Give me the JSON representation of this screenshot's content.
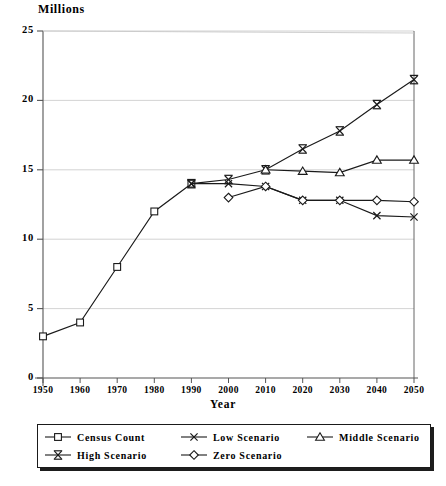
{
  "chart_data": {
    "type": "line",
    "title": "",
    "unit_label": "Millions",
    "xlabel": "Year",
    "ylabel": "",
    "x": [
      1950,
      1960,
      1970,
      1980,
      1990,
      2000,
      2010,
      2020,
      2030,
      2040,
      2050
    ],
    "xtick_labels": [
      "1950",
      "1960",
      "1970",
      "1980",
      "1990",
      "2000",
      "2010",
      "2020",
      "2030",
      "2040",
      "2050"
    ],
    "ytick_labels": [
      "0",
      "5",
      "10",
      "15",
      "20",
      "25"
    ],
    "ytick_values": [
      0,
      5,
      10,
      15,
      20,
      25
    ],
    "ylim": [
      0,
      25
    ],
    "xlim": [
      1950,
      2050
    ],
    "grid": "horizontal",
    "legend_position": "bottom",
    "series": [
      {
        "name": "Census Count",
        "marker": "square",
        "x": [
          1950,
          1960,
          1970,
          1980,
          1990
        ],
        "values": [
          3.0,
          4.0,
          8.0,
          12.0,
          14.0
        ]
      },
      {
        "name": "High Scenario",
        "marker": "i-bar",
        "x": [
          1990,
          2000,
          2010,
          2020,
          2030,
          2040,
          2050
        ],
        "values": [
          14.0,
          14.3,
          15.0,
          16.5,
          17.8,
          19.7,
          21.5
        ]
      },
      {
        "name": "Middle Scenario",
        "marker": "triangle",
        "x": [
          2010,
          2020,
          2030,
          2040,
          2050
        ],
        "values": [
          15.0,
          14.9,
          14.8,
          15.7,
          15.7
        ]
      },
      {
        "name": "Low Scenario",
        "marker": "x",
        "x": [
          1990,
          2000,
          2010,
          2020,
          2030,
          2040,
          2050
        ],
        "values": [
          14.0,
          14.0,
          13.8,
          12.8,
          12.8,
          11.7,
          11.6
        ]
      },
      {
        "name": "Zero Scenario",
        "marker": "diamond",
        "x": [
          2000,
          2010,
          2020,
          2030,
          2040,
          2050
        ],
        "values": [
          13.0,
          13.8,
          12.8,
          12.8,
          12.8,
          12.7
        ]
      }
    ],
    "colors": {
      "line": "#1a1a1a",
      "grid": "#c8c8c8",
      "axis": "#555555",
      "background": "#ffffff"
    }
  },
  "legend": {
    "entries": [
      {
        "label": "Census Count",
        "marker": "square",
        "col": 0,
        "row": 0
      },
      {
        "label": "High Scenario",
        "marker": "i-bar",
        "col": 0,
        "row": 1
      },
      {
        "label": "Low Scenario",
        "marker": "x",
        "col": 1,
        "row": 0
      },
      {
        "label": "Zero Scenario",
        "marker": "diamond",
        "col": 1,
        "row": 1
      },
      {
        "label": "Middle Scenario",
        "marker": "triangle",
        "col": 2,
        "row": 0
      }
    ]
  }
}
